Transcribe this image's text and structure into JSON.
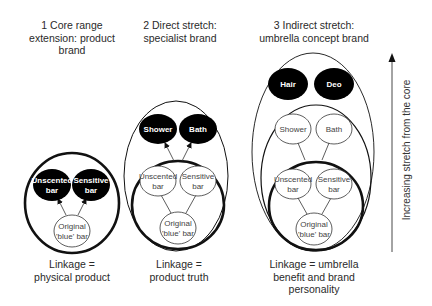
{
  "columns": [
    {
      "title_lines": [
        "1 Core range",
        "extension: product",
        "brand"
      ],
      "linkage_lines": [
        "Linkage =",
        "physical product"
      ],
      "nodes": {
        "unscented": [
          "Unscented",
          "bar"
        ],
        "sensitive": [
          "Sensitive",
          "bar"
        ],
        "original": [
          "Original",
          "'blue' bar"
        ]
      }
    },
    {
      "title_lines": [
        "2 Direct stretch:",
        "specialist brand"
      ],
      "linkage_lines": [
        "Linkage =",
        "product truth"
      ],
      "nodes": {
        "shower": "Shower",
        "bath": "Bath",
        "unscented": [
          "Unscented",
          "bar"
        ],
        "sensitive": [
          "Sensitive",
          "bar"
        ],
        "original": [
          "Original",
          "'blue' bar"
        ]
      }
    },
    {
      "title_lines": [
        "3 Indirect stretch:",
        "umbrella concept brand"
      ],
      "linkage_lines": [
        "Linkage = umbrella",
        "benefit and brand",
        "personality"
      ],
      "nodes": {
        "hair": "Hair",
        "deo": "Deo",
        "shower": "Shower",
        "bath": "Bath",
        "unscented": [
          "Unscented",
          "bar"
        ],
        "sensitive": [
          "Sensitive",
          "bar"
        ],
        "original": [
          "Original",
          "'blue' bar"
        ]
      }
    }
  ],
  "axis": {
    "label": "Increasing stretch from the core",
    "direction": "up"
  },
  "colors": {
    "new_extension_fill": "#000000",
    "existing_fill": "#ffffff",
    "stroke": "#111111"
  }
}
